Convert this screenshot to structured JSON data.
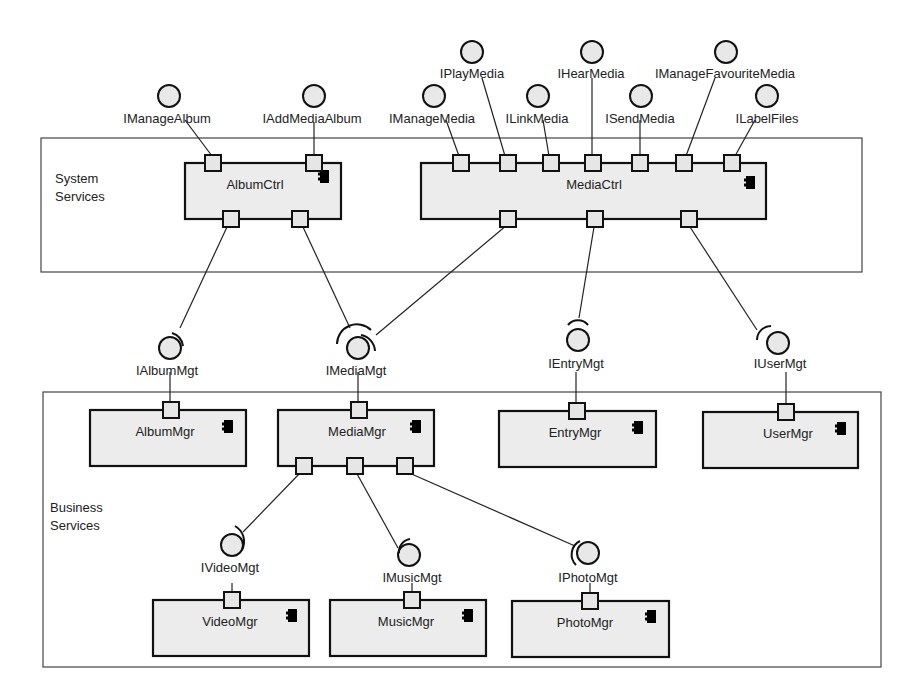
{
  "diagram": {
    "type": "UML component diagram",
    "frames": [
      {
        "id": "system-services",
        "label_line1": "System",
        "label_line2": "Services"
      },
      {
        "id": "business-services",
        "label_line1": "Business",
        "label_line2": "Services"
      }
    ],
    "components": {
      "album_ctrl": "AlbumCtrl",
      "media_ctrl": "MediaCtrl",
      "album_mgr": "AlbumMgr",
      "media_mgr": "MediaMgr",
      "entry_mgr": "EntryMgr",
      "user_mgr": "UserMgr",
      "video_mgr": "VideoMgr",
      "music_mgr": "MusicMgr",
      "photo_mgr": "PhotoMgr"
    },
    "provided_interfaces": {
      "i_manage_album": "IManageAlbum",
      "i_add_media_album": "IAddMediaAlbum",
      "i_manage_media": "IManageMedia",
      "i_play_media": "IPlayMedia",
      "i_link_media": "ILinkMedia",
      "i_hear_media": "IHearMedia",
      "i_send_media": "ISendMedia",
      "i_manage_favourite_media": "IManageFavouriteMedia",
      "i_label_files": "ILabelFiles"
    },
    "assembly_interfaces": {
      "i_album_mgt": "IAlbumMgt",
      "i_media_mgt": "IMediaMgt",
      "i_entry_mgt": "IEntryMgt",
      "i_user_mgt": "IUserMgt",
      "i_video_mgt": "IVideoMgt",
      "i_music_mgt": "IMusicMgt",
      "i_photo_mgt": "IPhotoMgt"
    },
    "connections": [
      {
        "from": "AlbumCtrl",
        "to": "IAlbumMgt",
        "provider": "AlbumMgr"
      },
      {
        "from": "AlbumCtrl",
        "to": "IMediaMgt",
        "provider": "MediaMgr"
      },
      {
        "from": "MediaCtrl",
        "to": "IMediaMgt",
        "provider": "MediaMgr"
      },
      {
        "from": "MediaCtrl",
        "to": "IEntryMgt",
        "provider": "EntryMgr"
      },
      {
        "from": "MediaCtrl",
        "to": "IUserMgt",
        "provider": "UserMgr"
      },
      {
        "from": "MediaMgr",
        "to": "IVideoMgt",
        "provider": "VideoMgr"
      },
      {
        "from": "MediaMgr",
        "to": "IMusicMgt",
        "provider": "MusicMgr"
      },
      {
        "from": "MediaMgr",
        "to": "IPhotoMgt",
        "provider": "PhotoMgr"
      }
    ],
    "colors": {
      "component_fill": "#ececec",
      "stroke": "#111111",
      "background": "#ffffff"
    }
  }
}
